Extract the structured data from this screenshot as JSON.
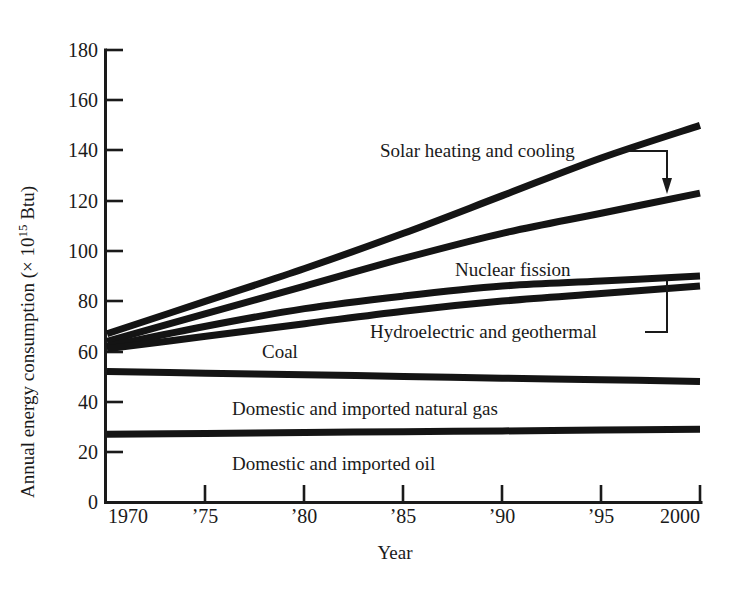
{
  "figure": {
    "background": "#ffffff",
    "ink_color": "#141414"
  },
  "chart_data": {
    "type": "line",
    "title": "",
    "xlabel": "Year",
    "ylabel": "Annual energy consumption (× 10¹⁵ Btu)",
    "ylabel_prefix": "Annual energy consumption (× 10",
    "ylabel_exponent": "15",
    "ylabel_suffix": " Btu)",
    "xlim": [
      1970,
      2000
    ],
    "ylim": [
      0,
      180
    ],
    "grid": false,
    "legend_position": "inline-annotations",
    "yticks": [
      0,
      20,
      40,
      60,
      80,
      100,
      120,
      140,
      160,
      180
    ],
    "ytick_labels": [
      "0",
      "20",
      "40",
      "60",
      "80",
      "100",
      "120",
      "140",
      "160",
      "180"
    ],
    "xticks": [
      1970,
      1975,
      1980,
      1985,
      1990,
      1995,
      2000
    ],
    "xtick_labels": [
      "1970",
      "’75",
      "’80",
      "’85",
      "’90",
      "’95",
      "2000"
    ],
    "x": [
      1970,
      1975,
      1980,
      1985,
      1990,
      1995,
      2000
    ],
    "series": [
      {
        "name": "Solar heating and cooling",
        "values": [
          67,
          80,
          93,
          107,
          122,
          137,
          150
        ]
      },
      {
        "name": "Nuclear fission",
        "values": [
          64,
          75,
          86,
          97,
          107,
          115,
          123
        ]
      },
      {
        "name": "Coal",
        "values": [
          62,
          70,
          77,
          82,
          86,
          88,
          90
        ]
      },
      {
        "name": "Hydroelectric and geothermal",
        "values": [
          61,
          66,
          71,
          76,
          80,
          83,
          86
        ]
      },
      {
        "name": "Domestic and imported natural gas",
        "values": [
          52,
          51.3,
          50.7,
          50,
          49.3,
          48.7,
          48
        ]
      },
      {
        "name": "Domestic and imported oil",
        "values": [
          27,
          27.3,
          27.7,
          28,
          28.3,
          28.7,
          29
        ]
      }
    ],
    "annotations": [
      {
        "text": "Solar heating and cooling",
        "kind": "arrow-callout",
        "points_to_series": "Nuclear fission"
      },
      {
        "text": "Nuclear fission",
        "kind": "inline-label"
      },
      {
        "text": "Hydroelectric and geothermal",
        "kind": "bracket-leader",
        "points_to_series": "Hydroelectric and geothermal"
      },
      {
        "text": "Coal",
        "kind": "inline-label"
      },
      {
        "text": "Domestic and imported natural gas",
        "kind": "inline-label"
      },
      {
        "text": "Domestic and imported oil",
        "kind": "inline-label"
      }
    ]
  }
}
